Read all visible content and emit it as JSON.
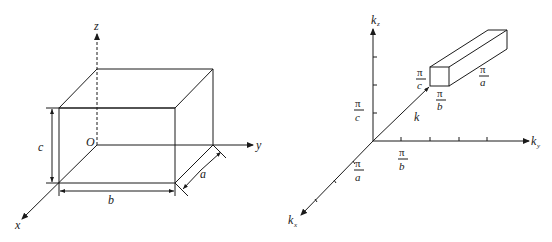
{
  "left_diagram": {
    "title": "Rectangular box in real space",
    "axes": {
      "x": "x",
      "y": "y",
      "z": "z"
    },
    "origin_label": "O",
    "dimensions": {
      "a": "a",
      "b": "b",
      "c": "c"
    }
  },
  "right_diagram": {
    "title": "Wave-vector lattice in k-space",
    "axes": {
      "kx": {
        "base": "k",
        "sub": "x"
      },
      "ky": {
        "base": "k",
        "sub": "y"
      },
      "kz": {
        "base": "k",
        "sub": "z"
      }
    },
    "vector_label": "k",
    "spacing_labels": {
      "kx": {
        "num": "π",
        "den": "a"
      },
      "ky": {
        "num": "π",
        "den": "b"
      },
      "kz": {
        "num": "π",
        "den": "c"
      }
    },
    "cell_labels": {
      "height": {
        "num": "π",
        "den": "c"
      },
      "width": {
        "num": "π",
        "den": "b"
      },
      "depth": {
        "num": "π",
        "den": "a"
      }
    }
  },
  "colors": {
    "line": "#1a1a1a",
    "background": "#ffffff"
  }
}
